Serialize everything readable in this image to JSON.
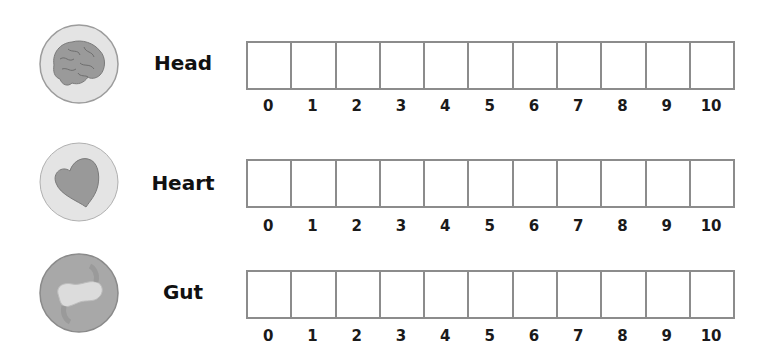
{
  "scale": {
    "values": [
      "0",
      "1",
      "2",
      "3",
      "4",
      "5",
      "6",
      "7",
      "8",
      "9",
      "10"
    ]
  },
  "rows": [
    {
      "label": "Head",
      "icon": "brain-icon"
    },
    {
      "label": "Heart",
      "icon": "heart-icon"
    },
    {
      "label": "Gut",
      "icon": "gut-icon"
    }
  ],
  "colors": {
    "icon_bg": "#e6e6e6",
    "icon_fill": "#9a9a9a",
    "border": "#8c8c8c"
  }
}
